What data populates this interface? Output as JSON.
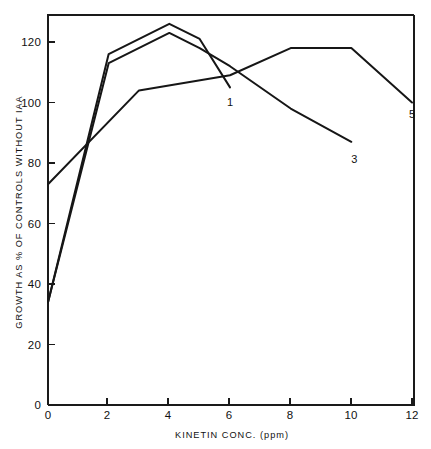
{
  "chart_data": {
    "type": "line",
    "title": "",
    "xlabel": "KINETIN CONC. (ppm)",
    "ylabel": "GROWTH AS % OF CONTROLS WITHOUT IAA",
    "xlim": [
      0,
      12.4
    ],
    "ylim": [
      0,
      130
    ],
    "xticks": [
      0,
      2,
      4,
      6,
      8,
      10,
      12
    ],
    "xticklabels": [
      "0",
      "2",
      "4",
      "6",
      "8",
      "10",
      "12"
    ],
    "yticks": [
      0,
      20,
      40,
      60,
      80,
      100,
      120
    ],
    "yticklabels": [
      "0",
      "20",
      "40",
      "60",
      "80",
      "100",
      "120"
    ],
    "grid": false,
    "legend": "inline-end-labels",
    "series": [
      {
        "name": "1",
        "label": "1",
        "label_x": 6.0,
        "label_y": 99,
        "x": [
          0,
          2,
          4,
          5,
          6
        ],
        "y": [
          34,
          116,
          126,
          121,
          105
        ]
      },
      {
        "name": "3",
        "label": "3",
        "label_x": 10.1,
        "label_y": 80,
        "x": [
          0,
          2,
          4,
          5,
          6,
          8,
          10
        ],
        "y": [
          34,
          113,
          123,
          118,
          112,
          98,
          87
        ]
      },
      {
        "name": "5",
        "label": "5",
        "label_x": 12.0,
        "label_y": 95,
        "x": [
          0,
          3,
          6,
          8,
          10,
          12
        ],
        "y": [
          73,
          104,
          109,
          118,
          118,
          100
        ]
      }
    ]
  },
  "colors": {
    "ink": "#161616",
    "axis": "#1a1a1a",
    "background": "#ffffff"
  }
}
